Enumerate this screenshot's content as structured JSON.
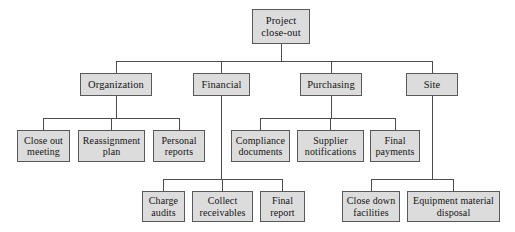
{
  "diagram": {
    "type": "tree",
    "orientation": "top-down",
    "colors": {
      "box_fill": "#dcdcdc",
      "box_border": "#595959",
      "connector": "#4d4d4d",
      "text": "#141414",
      "background": "#ffffff"
    },
    "nodes": {
      "root": {
        "label": "Project\nclose-out",
        "x": 252,
        "y": 9,
        "w": 58,
        "h": 35,
        "level": 0
      },
      "organization": {
        "label": "Organization",
        "x": 80,
        "y": 73,
        "w": 72,
        "h": 23,
        "level": 1
      },
      "financial": {
        "label": "Financial",
        "x": 193,
        "y": 73,
        "w": 57,
        "h": 23,
        "level": 1
      },
      "purchasing": {
        "label": "Purchasing",
        "x": 300,
        "y": 73,
        "w": 62,
        "h": 23,
        "level": 1
      },
      "site": {
        "label": "Site",
        "x": 406,
        "y": 73,
        "w": 52,
        "h": 23,
        "level": 1
      },
      "close_out_meeting": {
        "label": "Close out\nmeeting",
        "x": 17,
        "y": 130,
        "w": 53,
        "h": 32,
        "level": 2
      },
      "reassignment_plan": {
        "label": "Reassignment\nplan",
        "x": 78,
        "y": 130,
        "w": 67,
        "h": 32,
        "level": 2
      },
      "personal_reports": {
        "label": "Personal\nreports",
        "x": 153,
        "y": 130,
        "w": 52,
        "h": 32,
        "level": 2
      },
      "compliance_documents": {
        "label": "Compliance\ndocuments",
        "x": 231,
        "y": 130,
        "w": 59,
        "h": 32,
        "level": 2
      },
      "supplier_notifications": {
        "label": "Supplier\nnotifications",
        "x": 297,
        "y": 130,
        "w": 67,
        "h": 32,
        "level": 2
      },
      "final_payments": {
        "label": "Final\npayments",
        "x": 370,
        "y": 130,
        "w": 50,
        "h": 32,
        "level": 2
      },
      "charge_audits": {
        "label": "Charge\naudits",
        "x": 142,
        "y": 191,
        "w": 43,
        "h": 31,
        "level": 3
      },
      "collect_receivables": {
        "label": "Collect\nreceivables",
        "x": 192,
        "y": 191,
        "w": 61,
        "h": 31,
        "level": 3
      },
      "final_report": {
        "label": "Final\nreport",
        "x": 260,
        "y": 191,
        "w": 45,
        "h": 31,
        "level": 3
      },
      "close_down_facilities": {
        "label": "Close down\nfacilities",
        "x": 342,
        "y": 191,
        "w": 58,
        "h": 31,
        "level": 3
      },
      "equipment_material_disposal": {
        "label": "Equipment material\ndisposal",
        "x": 407,
        "y": 191,
        "w": 93,
        "h": 31,
        "level": 3
      }
    },
    "edges": [
      {
        "from": "root",
        "to": "organization"
      },
      {
        "from": "root",
        "to": "financial"
      },
      {
        "from": "root",
        "to": "purchasing"
      },
      {
        "from": "root",
        "to": "site"
      },
      {
        "from": "organization",
        "to": "close_out_meeting"
      },
      {
        "from": "organization",
        "to": "reassignment_plan"
      },
      {
        "from": "organization",
        "to": "personal_reports"
      },
      {
        "from": "purchasing",
        "to": "compliance_documents"
      },
      {
        "from": "purchasing",
        "to": "supplier_notifications"
      },
      {
        "from": "purchasing",
        "to": "final_payments"
      },
      {
        "from": "financial",
        "to": "charge_audits"
      },
      {
        "from": "financial",
        "to": "collect_receivables"
      },
      {
        "from": "financial",
        "to": "final_report"
      },
      {
        "from": "site",
        "to": "close_down_facilities"
      },
      {
        "from": "site",
        "to": "equipment_material_disposal"
      }
    ],
    "connector_geometry": {
      "root_bus_y": 61,
      "level1_bus_y": 118,
      "level2_bus_y": 179
    }
  }
}
